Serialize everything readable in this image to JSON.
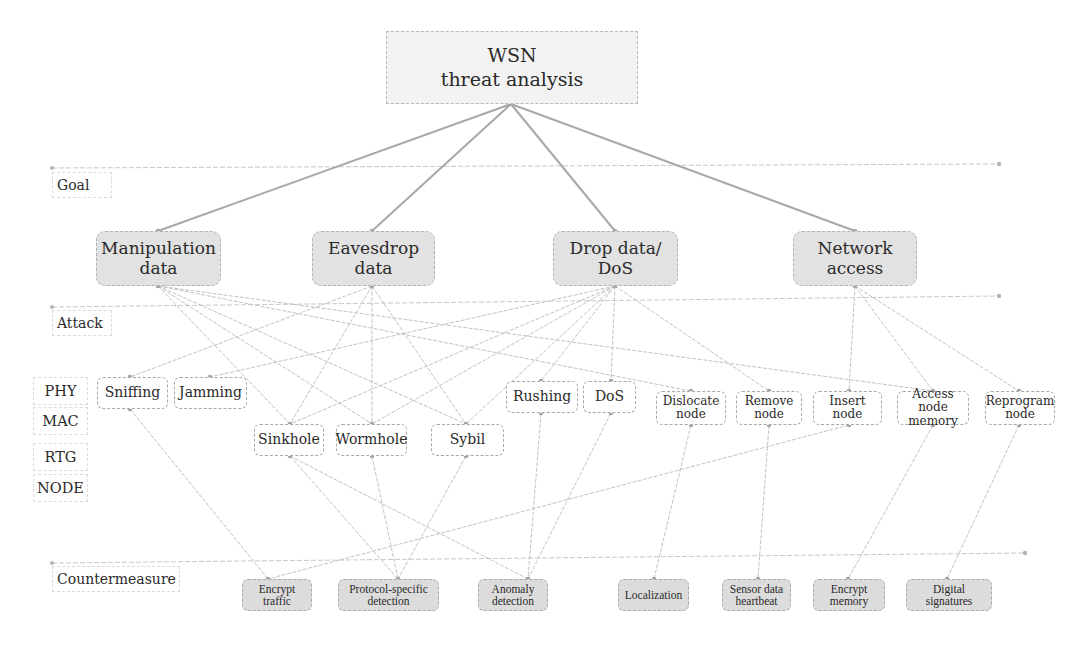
{
  "title": "WSN\nthreat analysis",
  "level_labels": {
    "goal": "Goal",
    "attack": "Attack",
    "countermeasure": "Countermeasure"
  },
  "layer_labels": [
    "PHY",
    "MAC",
    "RTG",
    "NODE"
  ],
  "goals": [
    {
      "id": "manip",
      "label": "Manipulation\ndata"
    },
    {
      "id": "eaves",
      "label": "Eavesdrop\ndata"
    },
    {
      "id": "drop",
      "label": "Drop data/\nDoS"
    },
    {
      "id": "netacc",
      "label": "Network\naccess"
    }
  ],
  "attacks": [
    {
      "id": "sniffing",
      "label": "Sniffing",
      "layer": "PHY"
    },
    {
      "id": "jamming",
      "label": "Jamming",
      "layer": "PHY"
    },
    {
      "id": "sinkhole",
      "label": "Sinkhole",
      "layer": "RTG"
    },
    {
      "id": "wormhole",
      "label": "Wormhole",
      "layer": "RTG"
    },
    {
      "id": "sybil",
      "label": "Sybil",
      "layer": "RTG"
    },
    {
      "id": "rushing",
      "label": "Rushing",
      "layer": "MAC"
    },
    {
      "id": "dos",
      "label": "DoS",
      "layer": "MAC"
    },
    {
      "id": "dislocate",
      "label": "Dislocate\nnode",
      "layer": "NODE"
    },
    {
      "id": "remove",
      "label": "Remove\nnode",
      "layer": "NODE"
    },
    {
      "id": "insert",
      "label": "Insert\nnode",
      "layer": "NODE"
    },
    {
      "id": "accessmem",
      "label": "Access node\nmemory",
      "layer": "NODE"
    },
    {
      "id": "reprogram",
      "label": "Reprogram\nnode",
      "layer": "NODE"
    }
  ],
  "countermeasures": [
    {
      "id": "enc_traffic",
      "label": "Encrypt\ntraffic"
    },
    {
      "id": "proto_det",
      "label": "Protocol-specific\ndetection"
    },
    {
      "id": "anomaly",
      "label": "Anomaly\ndetection"
    },
    {
      "id": "localization",
      "label": "Localization"
    },
    {
      "id": "heartbeat",
      "label": "Sensor data\nheartbeat"
    },
    {
      "id": "enc_memory",
      "label": "Encrypt\nmemory"
    },
    {
      "id": "digsig",
      "label": "Digital\nsignatures"
    }
  ],
  "edges_root_goal": [
    [
      "root",
      "manip"
    ],
    [
      "root",
      "eaves"
    ],
    [
      "root",
      "drop"
    ],
    [
      "root",
      "netacc"
    ]
  ],
  "edges_goal_attack": [
    [
      "manip",
      "sinkhole"
    ],
    [
      "manip",
      "wormhole"
    ],
    [
      "manip",
      "sybil"
    ],
    [
      "manip",
      "dislocate"
    ],
    [
      "manip",
      "accessmem"
    ],
    [
      "eaves",
      "sniffing"
    ],
    [
      "eaves",
      "sinkhole"
    ],
    [
      "eaves",
      "wormhole"
    ],
    [
      "eaves",
      "sybil"
    ],
    [
      "drop",
      "jamming"
    ],
    [
      "drop",
      "sinkhole"
    ],
    [
      "drop",
      "wormhole"
    ],
    [
      "drop",
      "sybil"
    ],
    [
      "drop",
      "rushing"
    ],
    [
      "drop",
      "dos"
    ],
    [
      "drop",
      "remove"
    ],
    [
      "netacc",
      "insert"
    ],
    [
      "netacc",
      "accessmem"
    ],
    [
      "netacc",
      "reprogram"
    ]
  ],
  "edges_attack_countermeasure": [
    [
      "sniffing",
      "enc_traffic"
    ],
    [
      "insert",
      "enc_traffic"
    ],
    [
      "sinkhole",
      "proto_det"
    ],
    [
      "wormhole",
      "proto_det"
    ],
    [
      "sybil",
      "proto_det"
    ],
    [
      "sinkhole",
      "anomaly"
    ],
    [
      "rushing",
      "anomaly"
    ],
    [
      "dos",
      "anomaly"
    ],
    [
      "dislocate",
      "localization"
    ],
    [
      "remove",
      "heartbeat"
    ],
    [
      "accessmem",
      "enc_memory"
    ],
    [
      "reprogram",
      "digsig"
    ]
  ],
  "colors": {
    "edge_main": "#a8a8a8",
    "edge_minor": "#c2c2c2",
    "goal_fill": "#e2e2e2",
    "countermeasure_fill": "#dcdcdc",
    "root_fill": "#f3f3f3"
  }
}
